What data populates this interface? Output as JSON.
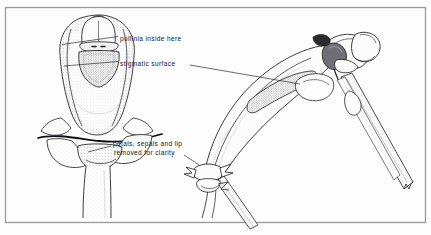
{
  "figure": {
    "kind": "botanical-line-drawing",
    "background_color": "#fdfdfd",
    "ink_color": "#1c1c20",
    "stipple_color": "#8a8a90",
    "border_color": "#9a9a9e",
    "views": [
      {
        "name": "front-view-column",
        "position": "left"
      },
      {
        "name": "lateral-view-column",
        "position": "right"
      }
    ]
  },
  "labels": {
    "pollinia": {
      "text": "pollinia inside here",
      "target": "anther-cap-front-view"
    },
    "stigmatic": {
      "text": "stigmatic surface",
      "target": "stigmatic-surface-front-view"
    },
    "petals_line1": "petals, sepals and lip",
    "petals_line2": "removed for clarity"
  }
}
